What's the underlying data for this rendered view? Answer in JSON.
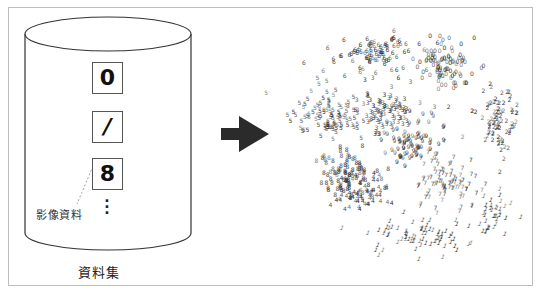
{
  "dataset": {
    "label": "資料集",
    "samples": [
      {
        "digit": "0",
        "style": "bold"
      },
      {
        "digit": "/",
        "style": "italic"
      },
      {
        "digit": "8",
        "style": "bold"
      }
    ],
    "ellipsis": "⋮",
    "callout_label": "影像資料"
  },
  "arrow": {
    "icon": "right-arrow-icon",
    "color": "#2b2b2b"
  },
  "embedding": {
    "description": "2D embedding scatter of handwritten digit images, clustered by digit class",
    "clusters": [
      {
        "digit": "0",
        "cx": 162,
        "cy": 42,
        "rx": 30,
        "ry": 24,
        "n": 90
      },
      {
        "digit": "6",
        "cx": 95,
        "cy": 30,
        "rx": 42,
        "ry": 18,
        "n": 90
      },
      {
        "digit": "5",
        "cx": 42,
        "cy": 92,
        "rx": 34,
        "ry": 28,
        "n": 95
      },
      {
        "digit": "3",
        "cx": 100,
        "cy": 88,
        "rx": 32,
        "ry": 22,
        "n": 90
      },
      {
        "digit": "2",
        "cx": 215,
        "cy": 98,
        "rx": 24,
        "ry": 32,
        "n": 85
      },
      {
        "digit": "8",
        "cx": 62,
        "cy": 150,
        "rx": 32,
        "ry": 26,
        "n": 90
      },
      {
        "digit": "9",
        "cx": 128,
        "cy": 120,
        "rx": 32,
        "ry": 22,
        "n": 80
      },
      {
        "digit": "4",
        "cx": 80,
        "cy": 170,
        "rx": 28,
        "ry": 20,
        "n": 60
      },
      {
        "digit": "7",
        "cx": 165,
        "cy": 160,
        "rx": 34,
        "ry": 26,
        "n": 85
      },
      {
        "digit": "1",
        "cx": 135,
        "cy": 212,
        "rx": 48,
        "ry": 18,
        "n": 70
      },
      {
        "digit": "1",
        "cx": 212,
        "cy": 190,
        "rx": 22,
        "ry": 24,
        "n": 40
      }
    ],
    "point_color": "#2a2a2a"
  },
  "colors": {
    "frame_border": "#bdbdbd",
    "ink": "#222222"
  }
}
